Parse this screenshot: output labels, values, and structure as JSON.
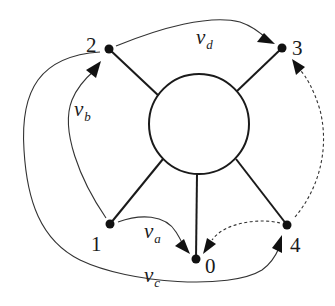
{
  "diagram": {
    "title": "",
    "hub": {
      "shape": "circle",
      "cx": 199,
      "cy": 124,
      "r": 50
    },
    "nodes": [
      {
        "id": "0",
        "label": "0",
        "x": 196,
        "y": 259
      },
      {
        "id": "1",
        "label": "1",
        "x": 110,
        "y": 224
      },
      {
        "id": "2",
        "label": "2",
        "x": 109,
        "y": 49
      },
      {
        "id": "3",
        "label": "3",
        "x": 282,
        "y": 48
      },
      {
        "id": "4",
        "label": "4",
        "x": 287,
        "y": 225
      }
    ],
    "spokes": [
      {
        "from": "hub",
        "to": "2"
      },
      {
        "from": "hub",
        "to": "3"
      },
      {
        "from": "hub",
        "to": "1"
      },
      {
        "from": "hub",
        "to": "0"
      },
      {
        "from": "hub",
        "to": "4"
      }
    ],
    "edges": [
      {
        "id": "v_a",
        "from": "1",
        "to": "0",
        "style": "solid",
        "label_main": "v",
        "label_sub": "a"
      },
      {
        "id": "v_b",
        "from": "1",
        "to": "2",
        "style": "solid",
        "label_main": "v",
        "label_sub": "b"
      },
      {
        "id": "v_c",
        "from": "2",
        "to": "4",
        "style": "solid",
        "label_main": "v",
        "label_sub": "c"
      },
      {
        "id": "v_d",
        "from": "2",
        "to": "3",
        "style": "solid",
        "label_main": "v",
        "label_sub": "d"
      },
      {
        "id": "dash_4_0",
        "from": "4",
        "to": "0",
        "style": "dashed",
        "label_main": "",
        "label_sub": ""
      },
      {
        "id": "dash_4_3",
        "from": "4",
        "to": "3",
        "style": "dashed",
        "label_main": "",
        "label_sub": ""
      }
    ],
    "colors": {
      "stroke": "#1a1a1a",
      "background": "#ffffff"
    }
  }
}
